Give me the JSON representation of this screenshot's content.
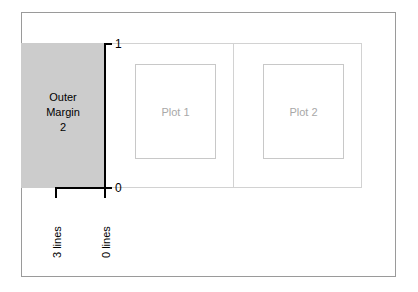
{
  "figure": {
    "background_color": "#ffffff",
    "frame_color": "#9a9a9a"
  },
  "outer_margin": {
    "line_1": "Outer",
    "line_2": "Margin",
    "line_3": "2",
    "fill_color": "#cccccc",
    "side": "left"
  },
  "axis": {
    "top_label": "1",
    "bottom_label": "0",
    "orientation": "vertical",
    "color": "#000000"
  },
  "measure": {
    "left_label": "3 lines",
    "right_label": "0 lines"
  },
  "plots": [
    {
      "label": "Plot 1",
      "text_color": "#a8a8a8",
      "border_color": "#c8c8c8"
    },
    {
      "label": "Plot 2",
      "text_color": "#a8a8a8",
      "border_color": "#c8c8c8"
    }
  ],
  "plot_region": {
    "border_color": "#d2d2d2",
    "divider_color": "#d2d2d2"
  }
}
